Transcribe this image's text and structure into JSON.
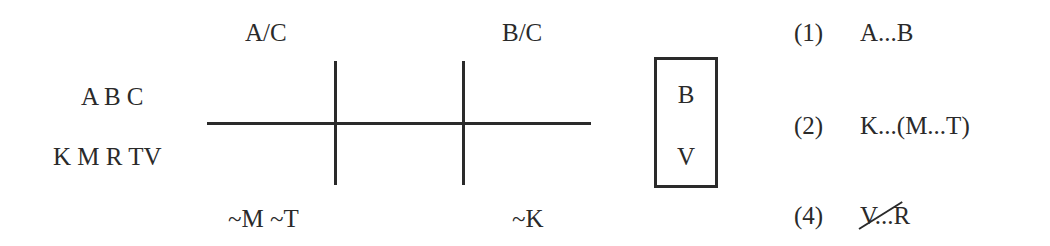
{
  "left_labels": {
    "top": "A B C",
    "bottom": "K M R TV"
  },
  "diagram": {
    "top_labels": [
      "A/C",
      "B/C"
    ],
    "bottom_labels": [
      "~M ~T",
      "~K"
    ]
  },
  "box": {
    "items": [
      "B",
      "V"
    ]
  },
  "constraints": [
    {
      "number": "(1)",
      "text": "A...B",
      "struck": false
    },
    {
      "number": "(2)",
      "text": "K...(M...T)",
      "struck": false
    },
    {
      "number": "(4)",
      "text": "V...R",
      "struck": true
    }
  ]
}
